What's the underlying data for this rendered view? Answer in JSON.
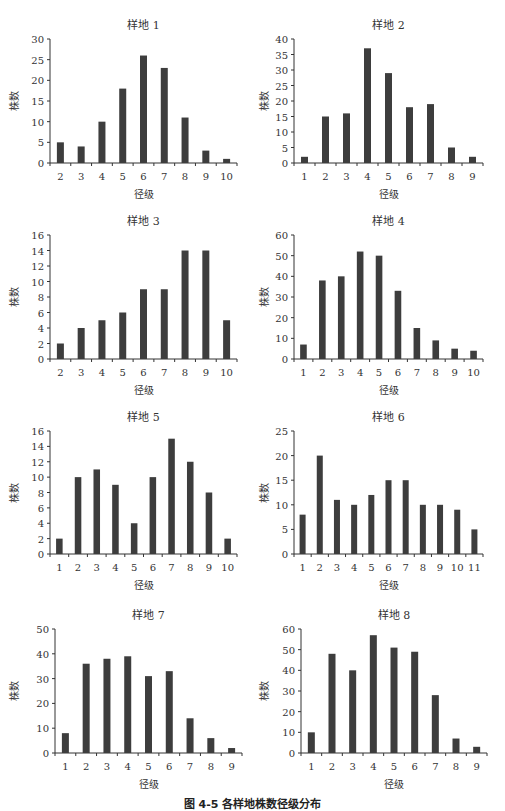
{
  "caption": "图 4-5  各样地株数径级分布",
  "chart_data": [
    {
      "type": "bar",
      "title": "样地 1",
      "xlabel": "径级",
      "ylabel": "株数",
      "ylim": [
        0,
        30
      ],
      "yticks": [
        0,
        5,
        10,
        15,
        20,
        25,
        30
      ],
      "categories": [
        "2",
        "3",
        "4",
        "5",
        "6",
        "7",
        "8",
        "9",
        "10"
      ],
      "values": [
        5,
        4,
        10,
        18,
        26,
        23,
        11,
        3,
        1
      ],
      "grid": false,
      "legend": null
    },
    {
      "type": "bar",
      "title": "样地 2",
      "xlabel": "径级",
      "ylabel": "株数",
      "ylim": [
        0,
        40
      ],
      "yticks": [
        0,
        5,
        10,
        15,
        20,
        25,
        30,
        35,
        40
      ],
      "categories": [
        "1",
        "2",
        "3",
        "4",
        "5",
        "6",
        "7",
        "8",
        "9"
      ],
      "values": [
        2,
        15,
        16,
        37,
        29,
        18,
        19,
        5,
        2
      ],
      "grid": false,
      "legend": null
    },
    {
      "type": "bar",
      "title": "样地 3",
      "xlabel": "径级",
      "ylabel": "株数",
      "ylim": [
        0,
        16
      ],
      "yticks": [
        0,
        2,
        4,
        6,
        8,
        10,
        12,
        14,
        16
      ],
      "categories": [
        "2",
        "3",
        "4",
        "5",
        "6",
        "7",
        "8",
        "9",
        "10"
      ],
      "values": [
        2,
        4,
        5,
        6,
        9,
        9,
        14,
        14,
        5
      ],
      "grid": false,
      "legend": null
    },
    {
      "type": "bar",
      "title": "样地 4",
      "xlabel": "径级",
      "ylabel": "株数",
      "ylim": [
        0,
        60
      ],
      "yticks": [
        0,
        10,
        20,
        30,
        40,
        50,
        60
      ],
      "categories": [
        "1",
        "2",
        "3",
        "4",
        "5",
        "6",
        "7",
        "8",
        "9",
        "10"
      ],
      "values": [
        7,
        38,
        40,
        52,
        50,
        33,
        15,
        9,
        5,
        4
      ],
      "grid": false,
      "legend": null
    },
    {
      "type": "bar",
      "title": "样地 5",
      "xlabel": "径级",
      "ylabel": "株数",
      "ylim": [
        0,
        16
      ],
      "yticks": [
        0,
        2,
        4,
        6,
        8,
        10,
        12,
        14,
        16
      ],
      "categories": [
        "1",
        "2",
        "3",
        "4",
        "5",
        "6",
        "7",
        "8",
        "9",
        "10"
      ],
      "values": [
        2,
        10,
        11,
        9,
        4,
        10,
        15,
        12,
        8,
        2
      ],
      "grid": false,
      "legend": null
    },
    {
      "type": "bar",
      "title": "样地 6",
      "xlabel": "径级",
      "ylabel": "株数",
      "ylim": [
        0,
        25
      ],
      "yticks": [
        0,
        5,
        10,
        15,
        20,
        25
      ],
      "categories": [
        "1",
        "2",
        "3",
        "4",
        "5",
        "6",
        "7",
        "8",
        "9",
        "10",
        "11"
      ],
      "values": [
        8,
        20,
        11,
        10,
        12,
        15,
        15,
        10,
        10,
        9,
        5
      ],
      "grid": false,
      "legend": null
    },
    {
      "type": "bar",
      "title": "样地 7",
      "xlabel": "径级",
      "ylabel": "株数",
      "ylim": [
        0,
        50
      ],
      "yticks": [
        0,
        10,
        20,
        30,
        40,
        50
      ],
      "categories": [
        "1",
        "2",
        "3",
        "4",
        "5",
        "6",
        "7",
        "8",
        "9"
      ],
      "values": [
        8,
        36,
        38,
        39,
        31,
        33,
        14,
        6,
        2
      ],
      "grid": false,
      "legend": null
    },
    {
      "type": "bar",
      "title": "样地 8",
      "xlabel": "径级",
      "ylabel": "株数",
      "ylim": [
        0,
        60
      ],
      "yticks": [
        0,
        10,
        20,
        30,
        40,
        50,
        60
      ],
      "categories": [
        "1",
        "2",
        "3",
        "4",
        "5",
        "6",
        "7",
        "8",
        "9"
      ],
      "values": [
        10,
        48,
        40,
        57,
        51,
        49,
        28,
        7,
        3
      ],
      "grid": false,
      "legend": null
    }
  ],
  "style": {
    "bar_color": "#3d3d3d",
    "axis_color": "#333333"
  },
  "layout": [
    {
      "left": 0,
      "top": 0,
      "axisX": 50,
      "axisTop": 39,
      "axisBottom": 163,
      "axisRight": 237
    },
    {
      "left": 250,
      "top": 0,
      "axisX": 44,
      "axisTop": 39,
      "axisBottom": 163,
      "axisRight": 233
    },
    {
      "left": 0,
      "top": 200,
      "axisX": 50,
      "axisTop": 35,
      "axisBottom": 159,
      "axisRight": 237
    },
    {
      "left": 250,
      "top": 200,
      "axisX": 44,
      "axisTop": 35,
      "axisBottom": 159,
      "axisRight": 233
    },
    {
      "left": 0,
      "top": 400,
      "axisX": 50,
      "axisTop": 31,
      "axisBottom": 154,
      "axisRight": 237
    },
    {
      "left": 250,
      "top": 400,
      "axisX": 44,
      "axisTop": 31,
      "axisBottom": 154,
      "axisRight": 233
    },
    {
      "left": 0,
      "top": 600,
      "axisX": 55,
      "axisTop": 29,
      "axisBottom": 153,
      "axisRight": 242
    },
    {
      "left": 250,
      "top": 600,
      "axisX": 51,
      "axisTop": 29,
      "axisBottom": 153,
      "axisRight": 237
    }
  ]
}
